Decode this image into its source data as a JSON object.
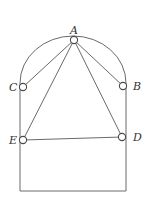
{
  "diagram": {
    "type": "geometry",
    "colors": {
      "line": "#6a6a6a",
      "node": "#4a4a4a",
      "label": "#333333",
      "background": "#ffffff"
    },
    "frame": {
      "left_x": 20,
      "right_x": 126,
      "bottom_y": 191,
      "arc_start_y": 83,
      "arc_top_y": 36
    },
    "points": [
      {
        "id": "A",
        "label": "A",
        "x": 74,
        "y": 40,
        "lx": 70,
        "ly": 34
      },
      {
        "id": "B",
        "label": "B",
        "x": 123,
        "y": 86,
        "lx": 133,
        "ly": 90
      },
      {
        "id": "C",
        "label": "C",
        "x": 23,
        "y": 87,
        "lx": 9,
        "ly": 91
      },
      {
        "id": "D",
        "label": "D",
        "x": 122,
        "y": 137,
        "lx": 133,
        "ly": 141
      },
      {
        "id": "E",
        "label": "E",
        "x": 23,
        "y": 140,
        "lx": 9,
        "ly": 144
      }
    ],
    "segments": [
      [
        "A",
        "C"
      ],
      [
        "A",
        "B"
      ],
      [
        "A",
        "E"
      ],
      [
        "A",
        "D"
      ],
      [
        "E",
        "D"
      ]
    ]
  }
}
